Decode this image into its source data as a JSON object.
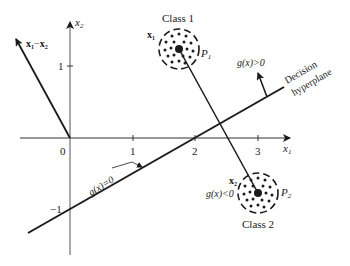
{
  "diagram": {
    "axes": {
      "x_label": "x",
      "x_label_sub": "1",
      "y_label": "x",
      "y_label_sub": "2",
      "origin_label": "0",
      "x_ticks": [
        "1",
        "2",
        "3"
      ],
      "y_ticks": [
        "1",
        "−1"
      ]
    },
    "classes": [
      {
        "name": "Class 1",
        "point_label": "x",
        "point_sub": "1",
        "pattern_label": "P",
        "pattern_sub": "1"
      },
      {
        "name": "Class 2",
        "point_label": "x",
        "point_sub": "2",
        "pattern_label": "P",
        "pattern_sub": "2"
      }
    ],
    "difference_vector": {
      "label_a": "x",
      "sub_a": "1",
      "minus": "−",
      "label_b": "x",
      "sub_b": "2"
    },
    "regions": {
      "positive": "g(x)>0",
      "negative": "g(x)<0",
      "boundary": "g(x)=0"
    },
    "hyperplane_label": [
      "Decision",
      "hyperplane"
    ],
    "colors": {
      "ink": "#1a1a1a",
      "background": "#ffffff"
    }
  }
}
